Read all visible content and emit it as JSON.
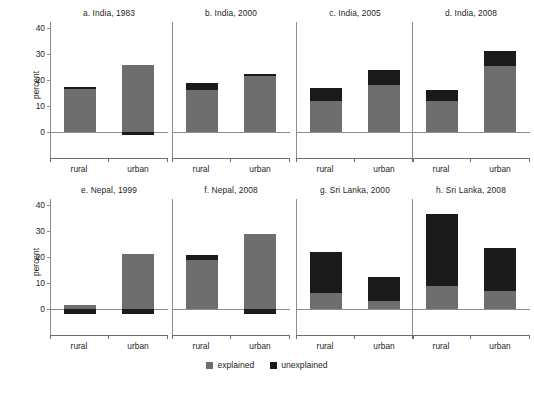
{
  "chart_data": {
    "type": "bar",
    "title": "",
    "ylabel": "percent",
    "xlabel": "",
    "ylim": [
      -5,
      44
    ],
    "yticks": [
      0,
      10,
      20,
      30,
      40
    ],
    "categories": [
      "rural",
      "urban"
    ],
    "grid": false,
    "legend_position": "bottom-center",
    "stacked": true,
    "series": [
      {
        "name": "explained",
        "color": "#6e6e6e"
      },
      {
        "name": "unexplained",
        "color": "#1a1a1a"
      }
    ],
    "panels": [
      {
        "key": "a",
        "title": "a. India, 1983",
        "bars": [
          {
            "category": "rural",
            "explained": 16.5,
            "unexplained": 1.0,
            "total": 17.5
          },
          {
            "category": "urban",
            "explained": 25.8,
            "unexplained": -1.2,
            "total": 24.6
          }
        ]
      },
      {
        "key": "b",
        "title": "b. India, 2000",
        "bars": [
          {
            "category": "rural",
            "explained": 16.0,
            "unexplained": 2.8,
            "total": 18.8
          },
          {
            "category": "urban",
            "explained": 21.4,
            "unexplained": 1.1,
            "total": 22.5
          }
        ]
      },
      {
        "key": "c",
        "title": "c. India, 2005",
        "bars": [
          {
            "category": "rural",
            "explained": 11.8,
            "unexplained": 5.2,
            "total": 17.0
          },
          {
            "category": "urban",
            "explained": 17.9,
            "unexplained": 6.1,
            "total": 24.0
          }
        ]
      },
      {
        "key": "d",
        "title": "d. India, 2008",
        "bars": [
          {
            "category": "rural",
            "explained": 11.9,
            "unexplained": 4.1,
            "total": 16.0
          },
          {
            "category": "urban",
            "explained": 25.4,
            "unexplained": 5.8,
            "total": 31.2
          }
        ]
      },
      {
        "key": "e",
        "title": "e. Nepal, 1999",
        "bars": [
          {
            "category": "rural",
            "explained": 1.6,
            "unexplained": -2.0,
            "total": -0.4
          },
          {
            "category": "urban",
            "explained": 21.0,
            "unexplained": -2.0,
            "total": 19.0
          }
        ]
      },
      {
        "key": "f",
        "title": "f. Nepal, 2008",
        "bars": [
          {
            "category": "rural",
            "explained": 19.0,
            "unexplained": 1.6,
            "total": 20.6
          },
          {
            "category": "urban",
            "explained": 28.8,
            "unexplained": -2.0,
            "total": 26.8
          }
        ]
      },
      {
        "key": "g",
        "title": "g. Sri Lanka, 2000",
        "bars": [
          {
            "category": "rural",
            "explained": 6.0,
            "unexplained": 16.0,
            "total": 22.0
          },
          {
            "category": "urban",
            "explained": 3.0,
            "unexplained": 9.5,
            "total": 12.5
          }
        ]
      },
      {
        "key": "h",
        "title": "h. Sri Lanka, 2008",
        "bars": [
          {
            "category": "rural",
            "explained": 9.0,
            "unexplained": 27.5,
            "total": 36.5
          },
          {
            "category": "urban",
            "explained": 7.0,
            "unexplained": 16.5,
            "total": 23.5
          }
        ]
      }
    ]
  },
  "axis": {
    "ylabel": "percent",
    "ytick_labels": [
      "40",
      "30",
      "20",
      "10",
      "0"
    ],
    "xtick_labels": [
      "rural",
      "urban"
    ]
  },
  "legend": {
    "items": [
      {
        "label": "explained",
        "color": "#6e6e6e"
      },
      {
        "label": "unexplained",
        "color": "#1a1a1a"
      }
    ]
  },
  "caption": {
    "text": ""
  }
}
